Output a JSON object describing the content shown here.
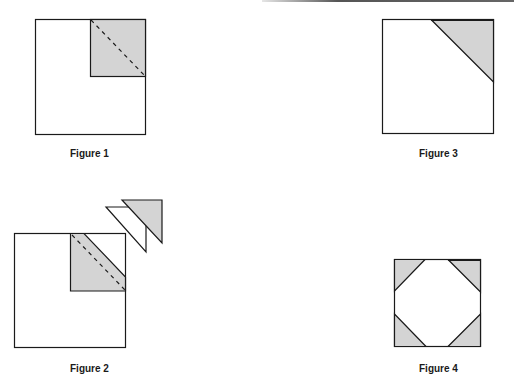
{
  "figures": [
    {
      "id": "figure-1",
      "caption": "Figure 1",
      "description": "Square with shaded upper-right quarter square and dashed diagonal"
    },
    {
      "id": "figure-2",
      "caption": "Figure 2",
      "description": "Square with shaded quarter folded along diagonal; two cut-off triangles shown separately"
    },
    {
      "id": "figure-3",
      "caption": "Figure 3",
      "description": "Square with shaded triangle in upper-right corner"
    },
    {
      "id": "figure-4",
      "caption": "Figure 4",
      "description": "Square with shaded triangles at all four corners, white octagon in center"
    }
  ],
  "colors": {
    "shade": "#d4d4d4",
    "stroke": "#1a1a1a",
    "background": "#ffffff"
  }
}
